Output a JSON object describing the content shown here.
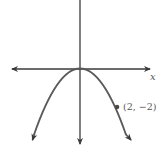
{
  "graph": {
    "equation": "y = -x^2/2",
    "x_axis_label": "x",
    "y_axis_label": "y",
    "point": {
      "x": 2,
      "y": -2,
      "label": "(2, −2)"
    },
    "colors": {
      "axis": "#3a3a3a",
      "curve": "#5a5a5a",
      "label": "#555555"
    }
  }
}
